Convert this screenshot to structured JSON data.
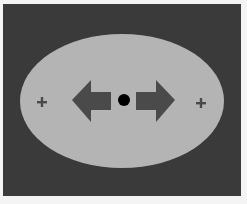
{
  "figure": {
    "background_color": "#3a3a3a",
    "page_color": "#f4f4f4",
    "ellipse": {
      "color": "#b4b4b4",
      "cx": 122,
      "cy": 101,
      "rx": 102,
      "ry": 67
    },
    "arrows": [
      {
        "direction": "left",
        "color": "#4a4a4a"
      },
      {
        "direction": "right",
        "color": "#4a4a4a"
      }
    ],
    "center_dot": {
      "color": "#000000"
    },
    "plus_signs": [
      {
        "label": "+",
        "side": "left"
      },
      {
        "label": "+",
        "side": "right"
      }
    ]
  }
}
